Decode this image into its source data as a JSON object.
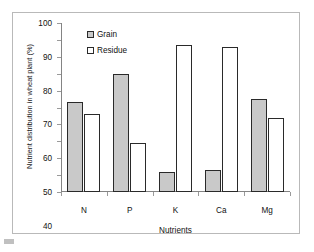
{
  "chart_data": {
    "type": "bar",
    "title": "",
    "xlabel": "Nutrients",
    "ylabel": "Nutrient distribution in wheat plant (%)",
    "categories": [
      "N",
      "P",
      "K",
      "Ca",
      "Mg"
    ],
    "series": [
      {
        "name": "Grain",
        "values": [
          53,
          70,
          12,
          13,
          55
        ],
        "color": "#c9c9c9"
      },
      {
        "name": "Residue",
        "values": [
          46,
          29,
          87,
          86,
          44
        ],
        "color": "#ffffff"
      }
    ],
    "ylim": [
      0,
      100
    ],
    "yticks": [
      0,
      10,
      20,
      30,
      40,
      50,
      60,
      70,
      80,
      90,
      100
    ],
    "ytick_labels": [
      "0",
      "10",
      "20",
      "30",
      "40",
      "50",
      "60",
      "70",
      "80",
      "90",
      "100"
    ],
    "grid": false,
    "legend_position": "top-center-left"
  },
  "legend": {
    "entries": [
      {
        "label": "Grain"
      },
      {
        "label": "Residue"
      }
    ]
  },
  "axes": {
    "y_title": "Nutrient distribution in wheat plant (%)",
    "x_title": "Nutrients"
  }
}
